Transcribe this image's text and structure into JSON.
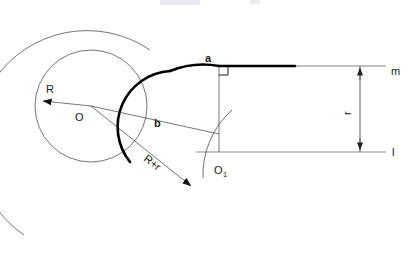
{
  "figure": {
    "title_faint": "",
    "background": "#ffffff",
    "stroke_primary": "#000000",
    "stroke_thin": "#3a3a3a"
  },
  "labels": {
    "radius_R": "R",
    "center_O": "O",
    "tangent_point_b": "b",
    "tangent_point_a": "a",
    "sum_radius": "R+r",
    "center_O1": "O",
    "center_O1_subscript": "1",
    "line_m": "m",
    "line_l": "l",
    "dimension_r": "r"
  },
  "geometry": {
    "base_circle": {
      "cx": 91,
      "cy": 106,
      "r": 56
    },
    "large_arc": {
      "cx": 219,
      "cy": 152,
      "r": 106
    },
    "fillet_arc": {
      "cx": 219,
      "cy": 152,
      "r": 87
    },
    "O1": {
      "x": 219,
      "y": 152
    },
    "point_a": {
      "x": 219,
      "y": 66
    },
    "point_b": {
      "x": 156,
      "y": 118
    },
    "line_m_y": 66,
    "line_l_y": 152,
    "dimension_x": 360,
    "thick_line_end_x": 295,
    "right_angle_size": 9
  },
  "icons": {
    "arrow_head": "triangle-arrowhead",
    "right_angle": "right-angle-marker"
  }
}
